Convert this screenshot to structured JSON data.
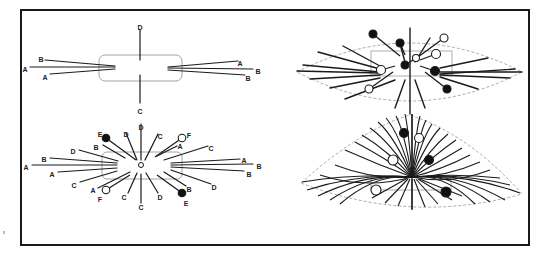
{
  "figure": {
    "frame": {
      "x": 20,
      "y": 9,
      "w": 510,
      "h": 237
    },
    "colors": {
      "ink": "#1a1a1a",
      "guide": "#9a9a9a",
      "dashed": "#a0a0a0",
      "fill_dark": "#111111",
      "fill_light": "#ffffff"
    },
    "panels": [
      {
        "id": "top-left",
        "description": "Prophase-like cell outline with sparse fibers labeled A–D",
        "box": {
          "x": 99,
          "y": 55,
          "w": 83,
          "h": 26,
          "r": 6
        },
        "lines": [
          {
            "x1": 140,
            "y1": 30,
            "x2": 140,
            "y2": 60,
            "label": "D",
            "lx": 140,
            "ly": 27
          },
          {
            "x1": 140,
            "y1": 75,
            "x2": 140,
            "y2": 103,
            "label": "C",
            "lx": 140,
            "ly": 111
          },
          {
            "x1": 45,
            "y1": 60,
            "x2": 115,
            "y2": 66,
            "label": "B",
            "lx": 41,
            "ly": 59
          },
          {
            "x1": 30,
            "y1": 67,
            "x2": 115,
            "y2": 67,
            "label": "A",
            "lx": 25,
            "ly": 69
          },
          {
            "x1": 50,
            "y1": 74,
            "x2": 115,
            "y2": 69,
            "label": "A",
            "lx": 45,
            "ly": 77
          },
          {
            "x1": 168,
            "y1": 67,
            "x2": 238,
            "y2": 61,
            "label": "A",
            "lx": 240,
            "ly": 63
          },
          {
            "x1": 168,
            "y1": 68,
            "x2": 253,
            "y2": 69,
            "label": "B",
            "lx": 258,
            "ly": 71
          },
          {
            "x1": 168,
            "y1": 70,
            "x2": 245,
            "y2": 75,
            "label": "B",
            "lx": 248,
            "ly": 78
          }
        ]
      },
      {
        "id": "bottom-left",
        "description": "Radial fiber array around central pole with kinetochore balls E (filled) and F (open)",
        "box": {
          "x": 102,
          "y": 152,
          "w": 80,
          "h": 27,
          "r": 5
        },
        "center": {
          "x": 141,
          "y": 165,
          "r": 2.5
        },
        "lines": [
          {
            "x1": 141,
            "y1": 124,
            "x2": 141,
            "y2": 160,
            "label": "D",
            "lx": 141,
            "ly": 127
          },
          {
            "x1": 126,
            "y1": 133,
            "x2": 137,
            "y2": 160,
            "label": "D",
            "lx": 126,
            "ly": 134
          },
          {
            "x1": 158,
            "y1": 134,
            "x2": 145,
            "y2": 160,
            "label": "C",
            "lx": 160,
            "ly": 136
          },
          {
            "x1": 103,
            "y1": 145,
            "x2": 125,
            "y2": 158,
            "label": "B",
            "lx": 96,
            "ly": 147
          },
          {
            "x1": 79,
            "y1": 150,
            "x2": 118,
            "y2": 161,
            "label": "D",
            "lx": 73,
            "ly": 151
          },
          {
            "x1": 50,
            "y1": 158,
            "x2": 117,
            "y2": 163,
            "label": "B",
            "lx": 44,
            "ly": 159
          },
          {
            "x1": 32,
            "y1": 165,
            "x2": 117,
            "y2": 165,
            "label": "A",
            "lx": 26,
            "ly": 167
          },
          {
            "x1": 58,
            "y1": 172,
            "x2": 117,
            "y2": 168,
            "label": "A",
            "lx": 52,
            "ly": 174
          },
          {
            "x1": 80,
            "y1": 182,
            "x2": 117,
            "y2": 171,
            "label": "C",
            "lx": 74,
            "ly": 185
          },
          {
            "x1": 98,
            "y1": 188,
            "x2": 130,
            "y2": 172,
            "label": "A",
            "lx": 93,
            "ly": 190
          },
          {
            "x1": 128,
            "y1": 193,
            "x2": 137,
            "y2": 173,
            "label": "C",
            "lx": 124,
            "ly": 197
          },
          {
            "x1": 141,
            "y1": 203,
            "x2": 141,
            "y2": 174,
            "label": "C",
            "lx": 141,
            "ly": 207
          },
          {
            "x1": 158,
            "y1": 193,
            "x2": 146,
            "y2": 173,
            "label": "D",
            "lx": 160,
            "ly": 197
          },
          {
            "x1": 186,
            "y1": 186,
            "x2": 164,
            "y2": 172,
            "label": "B",
            "lx": 189,
            "ly": 189
          },
          {
            "x1": 177,
            "y1": 146,
            "x2": 157,
            "y2": 156,
            "label": "A",
            "lx": 180,
            "ly": 146
          },
          {
            "x1": 208,
            "y1": 146,
            "x2": 164,
            "y2": 160,
            "label": "C",
            "lx": 211,
            "ly": 148
          },
          {
            "x1": 240,
            "y1": 159,
            "x2": 171,
            "y2": 163,
            "label": "A",
            "lx": 244,
            "ly": 160
          },
          {
            "x1": 253,
            "y1": 164,
            "x2": 171,
            "y2": 165,
            "label": "B",
            "lx": 259,
            "ly": 166
          },
          {
            "x1": 244,
            "y1": 171,
            "x2": 171,
            "y2": 167,
            "label": "B",
            "lx": 249,
            "ly": 174
          },
          {
            "x1": 211,
            "y1": 184,
            "x2": 171,
            "y2": 170,
            "label": "D",
            "lx": 214,
            "ly": 187
          }
        ],
        "balls": [
          {
            "cx": 106,
            "cy": 138,
            "r": 3.8,
            "fill": "dark",
            "x2": 136,
            "y2": 160,
            "label": "E",
            "lx": 100,
            "ly": 134
          },
          {
            "cx": 182,
            "cy": 138,
            "r": 3.8,
            "fill": "light",
            "x2": 155,
            "y2": 157,
            "label": "F",
            "lx": 189,
            "ly": 135
          },
          {
            "cx": 106,
            "cy": 190,
            "r": 3.8,
            "fill": "light",
            "x2": 130,
            "y2": 175,
            "label": "F",
            "lx": 100,
            "ly": 199
          },
          {
            "cx": 182,
            "cy": 193,
            "r": 3.8,
            "fill": "dark",
            "x2": 157,
            "y2": 175,
            "label": "E",
            "lx": 186,
            "ly": 203
          }
        ]
      },
      {
        "id": "top-right",
        "description": "Spindle (lens-shaped dashed outline) with fibers and kinetochores",
        "outline": "M297,72 Q410,14 522,72 Q410,130 297,72 Z",
        "box": {
          "x": 371,
          "y": 51,
          "w": 81,
          "h": 25
        },
        "lines": [
          {
            "x1": 410,
            "y1": 28,
            "x2": 410,
            "y2": 114
          },
          {
            "x1": 303,
            "y1": 65,
            "x2": 380,
            "y2": 72
          },
          {
            "x1": 297,
            "y1": 71,
            "x2": 380,
            "y2": 73
          },
          {
            "x1": 310,
            "y1": 79,
            "x2": 380,
            "y2": 75
          },
          {
            "x1": 343,
            "y1": 46,
            "x2": 380,
            "y2": 66
          },
          {
            "x1": 318,
            "y1": 52,
            "x2": 380,
            "y2": 69
          },
          {
            "x1": 330,
            "y1": 88,
            "x2": 380,
            "y2": 78
          },
          {
            "x1": 345,
            "y1": 99,
            "x2": 395,
            "y2": 80
          },
          {
            "x1": 395,
            "y1": 108,
            "x2": 405,
            "y2": 80
          },
          {
            "x1": 425,
            "y1": 108,
            "x2": 415,
            "y2": 80
          },
          {
            "x1": 430,
            "y1": 38,
            "x2": 415,
            "y2": 62
          },
          {
            "x1": 440,
            "y1": 74,
            "x2": 515,
            "y2": 69
          },
          {
            "x1": 440,
            "y1": 72,
            "x2": 522,
            "y2": 72
          },
          {
            "x1": 440,
            "y1": 75,
            "x2": 510,
            "y2": 78
          },
          {
            "x1": 440,
            "y1": 68,
            "x2": 488,
            "y2": 58
          },
          {
            "x1": 440,
            "y1": 77,
            "x2": 478,
            "y2": 89
          },
          {
            "x1": 400,
            "y1": 44,
            "x2": 405,
            "y2": 62
          }
        ],
        "balls": [
          {
            "cx": 373,
            "cy": 34,
            "r": 4,
            "fill": "dark",
            "x2": 400,
            "y2": 56
          },
          {
            "cx": 400,
            "cy": 43,
            "r": 4,
            "fill": "dark",
            "x2": 405,
            "y2": 55
          },
          {
            "cx": 444,
            "cy": 38,
            "r": 4,
            "fill": "light",
            "x2": 418,
            "y2": 57
          },
          {
            "cx": 436,
            "cy": 54,
            "r": 4.5,
            "fill": "light",
            "x2": 420,
            "y2": 60
          },
          {
            "cx": 416,
            "cy": 58,
            "r": 3.5,
            "fill": "light",
            "x2": 410,
            "y2": 62
          },
          {
            "cx": 405,
            "cy": 65,
            "r": 4,
            "fill": "dark",
            "x2": 410,
            "y2": 62
          },
          {
            "cx": 381,
            "cy": 70,
            "r": 4.5,
            "fill": "light",
            "x2": 395,
            "y2": 66
          },
          {
            "cx": 435,
            "cy": 71,
            "r": 4.5,
            "fill": "dark",
            "x2": 420,
            "y2": 66
          },
          {
            "cx": 369,
            "cy": 89,
            "r": 4,
            "fill": "light",
            "x2": 393,
            "y2": 72
          },
          {
            "cx": 447,
            "cy": 89,
            "r": 4,
            "fill": "dark",
            "x2": 425,
            "y2": 72
          }
        ]
      },
      {
        "id": "bottom-right",
        "description": "Fan-shaped spindle (dashed outline) with dense curving fibers converging at a pole",
        "outline": "M301,183 Q360,130 410,115 Q470,135 522,194 Q410,225 301,183 Z",
        "box": {
          "x": 371,
          "y": 177,
          "w": 80,
          "h": 13
        },
        "pole": {
          "x": 412,
          "y": 177
        },
        "balls": [
          {
            "cx": 404,
            "cy": 133,
            "r": 4.5,
            "fill": "dark"
          },
          {
            "cx": 419,
            "cy": 138,
            "r": 4.5,
            "fill": "light"
          },
          {
            "cx": 393,
            "cy": 160,
            "r": 5,
            "fill": "light"
          },
          {
            "cx": 429,
            "cy": 160,
            "r": 4.5,
            "fill": "dark"
          },
          {
            "cx": 376,
            "cy": 190,
            "r": 5,
            "fill": "light"
          },
          {
            "cx": 446,
            "cy": 192,
            "r": 5,
            "fill": "dark"
          }
        ]
      }
    ]
  }
}
